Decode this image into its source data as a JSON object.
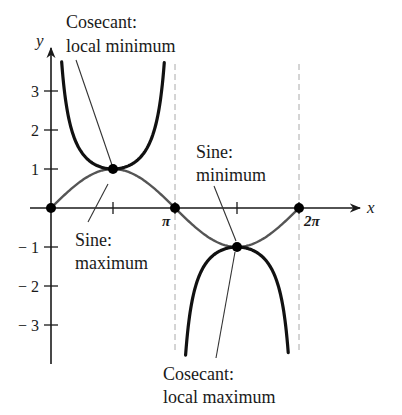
{
  "chart_data": {
    "type": "line",
    "title": "",
    "xlabel": "x",
    "ylabel": "y",
    "xlim": [
      0,
      6.6
    ],
    "ylim": [
      -3.7,
      3.7
    ],
    "grid": false,
    "x_ticks": [
      {
        "value": 1.5708,
        "label": ""
      },
      {
        "value": 3.1416,
        "label": "π"
      },
      {
        "value": 4.7124,
        "label": ""
      },
      {
        "value": 6.2832,
        "label": "2π"
      }
    ],
    "y_ticks": [
      {
        "value": 3,
        "label": "3"
      },
      {
        "value": 2,
        "label": "2"
      },
      {
        "value": 1,
        "label": "1"
      },
      {
        "value": -1,
        "label": "− 1"
      },
      {
        "value": -2,
        "label": "− 2"
      },
      {
        "value": -3,
        "label": "− 3"
      }
    ],
    "asymptotes": [
      3.1416,
      6.2832
    ],
    "series": [
      {
        "name": "Sine",
        "function": "sin(x)",
        "domain": [
          0,
          6.2832
        ],
        "stroke": "#555555",
        "width": 2.4
      },
      {
        "name": "Cosecant",
        "function": "csc(x)",
        "domain": [
          0.27,
          2.87
        ],
        "stroke": "#111111",
        "width": 3.2
      },
      {
        "name": "Cosecant",
        "function": "csc(x)",
        "domain": [
          3.41,
          6.01
        ],
        "stroke": "#111111",
        "width": 3.2
      }
    ],
    "points": [
      {
        "x": 0,
        "y": 0
      },
      {
        "x": 1.5708,
        "y": 1
      },
      {
        "x": 3.1416,
        "y": 0
      },
      {
        "x": 4.7124,
        "y": -1
      },
      {
        "x": 6.2832,
        "y": 0
      }
    ],
    "annotations": [
      {
        "id": "csc-local-min",
        "lines": [
          "Cosecant:",
          "local minimum"
        ],
        "target": {
          "x": 1.5708,
          "y": 1
        }
      },
      {
        "id": "sine-max",
        "lines": [
          "Sine:",
          "maximum"
        ],
        "target": {
          "x": 1.5708,
          "y": 1
        }
      },
      {
        "id": "sine-min",
        "lines": [
          "Sine:",
          "minimum"
        ],
        "target": {
          "x": 4.7124,
          "y": -1
        }
      },
      {
        "id": "csc-local-max",
        "lines": [
          "Cosecant:",
          "local maximum"
        ],
        "target": {
          "x": 4.7124,
          "y": -1
        }
      }
    ]
  },
  "labels": {
    "x_axis": "x",
    "y_axis": "y",
    "pi": "π",
    "two_pi": "2π",
    "csc_min_1": "Cosecant:",
    "csc_min_2": "local minimum",
    "sine_max_1": "Sine:",
    "sine_max_2": "maximum",
    "sine_min_1": "Sine:",
    "sine_min_2": "minimum",
    "csc_max_1": "Cosecant:",
    "csc_max_2": "local maximum",
    "y3": "3",
    "y2": "2",
    "y1": "1",
    "yn1": "− 1",
    "yn2": "− 2",
    "yn3": "− 3"
  },
  "colors": {
    "axis": "#1a1a1a",
    "sine": "#555555",
    "cosecant": "#111111",
    "asymptote": "#aaaaaa",
    "leader": "#333333",
    "point": "#000000"
  }
}
